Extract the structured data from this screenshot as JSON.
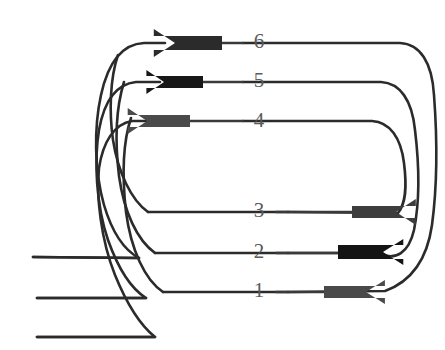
{
  "figure": {
    "title": "",
    "background_color": "#ffffff",
    "line_color": "#2b2b2b",
    "label_color": "#5a5a5a",
    "width": 445,
    "height": 350
  },
  "labels": [
    {
      "id": "label-6",
      "text": "6",
      "x": 259,
      "y": 43
    },
    {
      "id": "label-5",
      "text": "5",
      "x": 259,
      "y": 82
    },
    {
      "id": "label-4",
      "text": "4",
      "x": 259,
      "y": 122
    },
    {
      "id": "label-3",
      "text": "3",
      "x": 259,
      "y": 212
    },
    {
      "id": "label-2",
      "text": "2",
      "x": 259,
      "y": 253
    },
    {
      "id": "label-1",
      "text": "1",
      "x": 259,
      "y": 292
    }
  ],
  "arrows": [
    {
      "id": "arrow-6",
      "label": "6",
      "direction": "left",
      "color": "#2b2b2b",
      "tip_x": 175,
      "tail_x": 222,
      "y": 43,
      "head_half_height": 14,
      "shaft_half_height": 7
    },
    {
      "id": "arrow-5",
      "label": "5",
      "direction": "left",
      "color": "#171717",
      "tip_x": 164,
      "tail_x": 203,
      "y": 82,
      "head_half_height": 12,
      "shaft_half_height": 6
    },
    {
      "id": "arrow-4",
      "label": "4",
      "direction": "left",
      "color": "#4a4a4a",
      "tip_x": 147,
      "tail_x": 190,
      "y": 121,
      "head_half_height": 13,
      "shaft_half_height": 6
    },
    {
      "id": "arrow-3",
      "label": "3",
      "direction": "right",
      "color": "#3d3d3d",
      "tip_x": 396,
      "tail_x": 352,
      "y": 212,
      "head_half_height": 13,
      "shaft_half_height": 6
    },
    {
      "id": "arrow-2",
      "label": "2",
      "direction": "right",
      "color": "#141414",
      "tip_x": 383,
      "tail_x": 338,
      "y": 252,
      "head_half_height": 13,
      "shaft_half_height": 7
    },
    {
      "id": "arrow-1",
      "label": "1",
      "direction": "right",
      "color": "#4a4a4a",
      "tip_x": 366,
      "tail_x": 324,
      "y": 292,
      "head_half_height": 12,
      "shaft_half_height": 6
    }
  ],
  "paths": [
    {
      "id": "path-loop-outer",
      "name": "loop-6-to-1",
      "d": "M 243,43 L 400,43 C 420,44 432,62 434,95 C 437,135 438,180 432,225 C 427,260 410,282 385,291 L 288,292"
    },
    {
      "id": "path-loop-middle",
      "name": "loop-5-to-2",
      "d": "M 243,82 L 381,82 C 400,83 412,100 415,130 C 419,163 420,200 414,230 C 409,252 396,262 378,253 L 288,253"
    },
    {
      "id": "path-loop-inner",
      "name": "loop-4-to-3",
      "d": "M 243,121 L 372,121 C 390,122 401,138 404,163 C 407,187 406,203 398,213 L 288,212"
    },
    {
      "id": "path-left-outer",
      "name": "left-loop-6-to-tail-a",
      "d": "M 165,43 L 144,43 C 122,44 108,63 101,95 C 94,127 94,170 104,205 C 112,232 124,250 139,258 L 33,257"
    },
    {
      "id": "path-left-middle",
      "name": "left-loop-5-to-tail-b",
      "d": "M 160,82 L 136,82 C 116,84 104,102 99,130 C 94,160 96,205 108,240 C 118,268 130,288 146,298 L 37,298"
    },
    {
      "id": "path-left-inner",
      "name": "left-loop-4-to-tail-c",
      "d": "M 152,121 L 132,121 C 114,124 103,142 99,168 C 96,196 101,240 115,275 C 126,302 140,325 155,337 L 37,337"
    },
    {
      "id": "path-left-join-3",
      "name": "left-join-line-3",
      "d": "M 148,212 L 288,212"
    },
    {
      "id": "path-left-join-2",
      "name": "left-join-line-2",
      "d": "M 155,253 L 288,253"
    },
    {
      "id": "path-left-join-1",
      "name": "left-join-line-1",
      "d": "M 163,292 L 288,292"
    },
    {
      "id": "path-left-curve-3",
      "name": "left-curve-into-3",
      "d": "M 148,212 C 131,200 118,172 113,140 C 109,112 110,78 118,55"
    },
    {
      "id": "path-left-curve-2",
      "name": "left-curve-into-2",
      "d": "M 155,253 C 137,240 124,212 119,176 C 115,143 116,108 124,82"
    },
    {
      "id": "path-left-curve-1",
      "name": "left-curve-into-1",
      "d": "M 163,292 C 145,280 131,250 126,212 C 122,176 123,142 131,118"
    },
    {
      "id": "path-tail-a",
      "name": "free-end-upper",
      "d": "M 139,258 L 33,257"
    },
    {
      "id": "path-tail-b",
      "name": "free-end-middle",
      "d": "M 146,298 L 37,298"
    },
    {
      "id": "path-tail-c",
      "name": "free-end-lower",
      "d": "M 155,337 L 37,337"
    }
  ],
  "segments_center": [
    {
      "id": "seg-6",
      "d": "M 180,43 L 243,43"
    },
    {
      "id": "seg-5",
      "d": "M 170,82 L 243,82"
    },
    {
      "id": "seg-4",
      "d": "M 156,121 L 243,121"
    },
    {
      "id": "seg-3",
      "d": "M 276,212 L 360,212"
    },
    {
      "id": "seg-2",
      "d": "M 276,253 L 348,253"
    },
    {
      "id": "seg-1",
      "d": "M 276,292 L 334,292"
    }
  ]
}
